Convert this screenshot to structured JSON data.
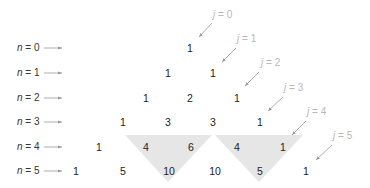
{
  "rows": [
    {
      "label_var": "n",
      "label_eq": " = 0",
      "values": [
        "1"
      ]
    },
    {
      "label_var": "n",
      "label_eq": " = 1",
      "values": [
        "1",
        "1"
      ]
    },
    {
      "label_var": "n",
      "label_eq": " = 2",
      "values": [
        "1",
        "2",
        "1"
      ]
    },
    {
      "label_var": "n",
      "label_eq": " = 3",
      "values": [
        "1",
        "3",
        "3",
        "1"
      ]
    },
    {
      "label_var": "n",
      "label_eq": " = 4",
      "values": [
        "1",
        "4",
        "6",
        "4",
        "1"
      ]
    },
    {
      "label_var": "n",
      "label_eq": " = 5",
      "values": [
        "1",
        "5",
        "10",
        "10",
        "5",
        "1"
      ]
    }
  ],
  "diagonals": [
    {
      "var": "j",
      "eq": " = 0"
    },
    {
      "var": "j",
      "eq": " = 1"
    },
    {
      "var": "j",
      "eq": " = 2"
    },
    {
      "var": "j",
      "eq": " = 3"
    },
    {
      "var": "j",
      "eq": " = 4"
    },
    {
      "var": "j",
      "eq": " = 5"
    }
  ],
  "highlights": [
    {
      "description": "4 + 6 = 10",
      "color": "#e6e6e6"
    },
    {
      "description": "4 + 1 = 5",
      "color": "#e6e6e6"
    }
  ],
  "colors": {
    "text": "#222222",
    "arrow": "#999999",
    "j_label": "#b8b8b8",
    "highlight": "#e6e6e6"
  }
}
